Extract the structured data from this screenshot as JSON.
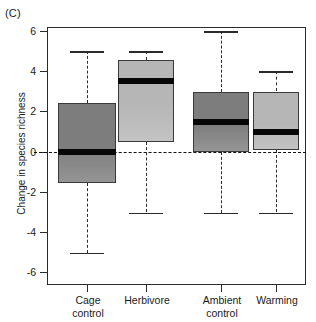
{
  "panel": {
    "letter": "(C)"
  },
  "axes": {
    "y_title": "Change in species richness",
    "y_ticks": [
      "6",
      "4",
      "2",
      "0",
      "-2",
      "-4",
      "-6"
    ],
    "x_labels": [
      "Cage\ncontrol",
      "Herbivore",
      "Ambient\ncontrol",
      "Warming"
    ]
  },
  "colors": {
    "dark_box": "#7d7d7d",
    "light_box": "#b6b6b6",
    "median": "#070707",
    "axis": "#2b2b2b",
    "zero_line": "#111111"
  },
  "chart_data": {
    "type": "box",
    "title": "(C)",
    "xlabel": "",
    "ylabel": "Change in species richness",
    "ylim": [
      -6.6,
      6.6
    ],
    "yticks": [
      6,
      4,
      2,
      0,
      -2,
      -4,
      -6
    ],
    "grid": false,
    "legend": "none",
    "zero_reference_line": 0,
    "categories": [
      "Cage control",
      "Herbivore",
      "Ambient control",
      "Warming"
    ],
    "boxes": [
      {
        "name": "Cage control",
        "whisker_low": -5.0,
        "q1": -1.55,
        "median": 0.0,
        "q3": 2.45,
        "whisker_high": 5.0,
        "fill": "dark"
      },
      {
        "name": "Herbivore",
        "whisker_low": -3.0,
        "q1": 0.5,
        "median": 3.5,
        "q3": 4.55,
        "whisker_high": 5.0,
        "fill": "light"
      },
      {
        "name": "Ambient control",
        "whisker_low": -3.0,
        "q1": 0.0,
        "median": 1.5,
        "q3": 3.0,
        "whisker_high": 6.0,
        "fill": "dark"
      },
      {
        "name": "Warming",
        "whisker_low": -3.0,
        "q1": 0.1,
        "median": 1.0,
        "q3": 3.0,
        "whisker_high": 4.0,
        "fill": "light"
      }
    ]
  }
}
